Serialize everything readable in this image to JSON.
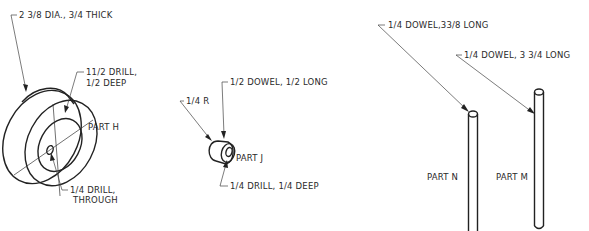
{
  "drawing": {
    "type": "isometric mechanical parts drawing",
    "parts": [
      {
        "id": "H",
        "label": "PART H",
        "notes": [
          "2 3/8 DIA., 3/4 THICK",
          "11/2 DRILL,",
          "1/2 DEEP",
          "1/4 DRILL,",
          "THROUGH"
        ]
      },
      {
        "id": "J",
        "label": "PART J",
        "notes": [
          "1/2 DOWEL, 1/2 LONG",
          "1/4 R",
          "1/4 DRILL, 1/4 DEEP"
        ]
      },
      {
        "id": "N",
        "label": "PART N",
        "notes": [
          "1/4 DOWEL,33/8 LONG"
        ]
      },
      {
        "id": "M",
        "label": "PART M",
        "notes": [
          "1/4 DOWEL, 3 3/4 LONG"
        ]
      }
    ]
  },
  "partH": {
    "label": "PART H",
    "note_dia": "2 3/8 DIA., 3/4 THICK",
    "note_drill_1": "11/2 DRILL,",
    "note_drill_2": "1/2 DEEP",
    "note_through_1": "1/4 DRILL,",
    "note_through_2": "THROUGH"
  },
  "partJ": {
    "label": "PART J",
    "note_dowel": "1/2 DOWEL, 1/2 LONG",
    "note_radius": "1/4 R",
    "note_drill": "1/4 DRILL, 1/4 DEEP"
  },
  "partN": {
    "label": "PART N",
    "note_dowel": "1/4 DOWEL,33/8 LONG"
  },
  "partM": {
    "label": "PART M",
    "note_dowel": "1/4 DOWEL, 3 3/4 LONG"
  }
}
